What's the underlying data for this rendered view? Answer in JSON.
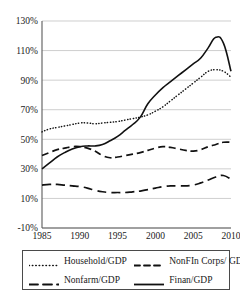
{
  "chart_data": {
    "type": "line",
    "title": "",
    "xlabel": "",
    "ylabel": "",
    "xlim": [
      1985,
      2010
    ],
    "ylim": [
      -10,
      130
    ],
    "grid": true,
    "legend_position": "bottom",
    "x_ticks": [
      "1985",
      "1990",
      "1995",
      "2000",
      "2005",
      "2010"
    ],
    "x_tick_values": [
      1985,
      1990,
      1995,
      2000,
      2005,
      2010
    ],
    "y_ticks": [
      "-10%",
      "10%",
      "30%",
      "50%",
      "70%",
      "90%",
      "110%",
      "130%"
    ],
    "y_tick_values": [
      -10,
      10,
      30,
      50,
      70,
      90,
      110,
      130
    ],
    "x": [
      1985,
      1986,
      1987,
      1988,
      1989,
      1990,
      1991,
      1992,
      1993,
      1994,
      1995,
      1996,
      1997,
      1998,
      1999,
      2000,
      2001,
      2002,
      2003,
      2004,
      2005,
      2006,
      2007,
      2008,
      2009,
      2010
    ],
    "series": [
      {
        "name": "Household/GDP",
        "style": "dotted",
        "values": [
          55,
          57,
          58,
          59,
          60,
          61,
          61,
          60.5,
          61,
          61.5,
          62,
          63,
          64,
          65,
          66.5,
          69,
          72,
          76,
          80,
          84,
          88,
          92,
          96,
          97,
          96,
          92
        ]
      },
      {
        "name": "NonFIn Corps/ GDP",
        "style": "dashed",
        "values": [
          39,
          41,
          43,
          44,
          45,
          45,
          44,
          42,
          39,
          37.5,
          38,
          39,
          40,
          41,
          42.5,
          44,
          45,
          44.5,
          43.5,
          42.5,
          42,
          43,
          45,
          46.5,
          48,
          48
        ]
      },
      {
        "name": "Nonfarm/GDP",
        "style": "long-dashed",
        "values": [
          19,
          19.5,
          19.5,
          19,
          18.5,
          18,
          17,
          15.5,
          14.5,
          14,
          14,
          14,
          14.5,
          15,
          16,
          17,
          18,
          18.5,
          18.5,
          18.5,
          19,
          20.5,
          22.5,
          24.5,
          25.5,
          23
        ]
      },
      {
        "name": "Finan/GDP",
        "style": "solid",
        "values": [
          30,
          34,
          38,
          41,
          43.5,
          45,
          45.5,
          45.5,
          46.5,
          49,
          52,
          56,
          60,
          65,
          74,
          80,
          85,
          89,
          93,
          97,
          101,
          105,
          112,
          119,
          115,
          96
        ]
      }
    ]
  },
  "legend": {
    "entries": [
      {
        "label": "Household/GDP",
        "style": "dotted"
      },
      {
        "label": "NonFIn Corps/ GDP",
        "style": "dashed"
      },
      {
        "label": "Nonfarm/GDP",
        "style": "long-dashed"
      },
      {
        "label": "Finan/GDP",
        "style": "solid"
      }
    ]
  }
}
